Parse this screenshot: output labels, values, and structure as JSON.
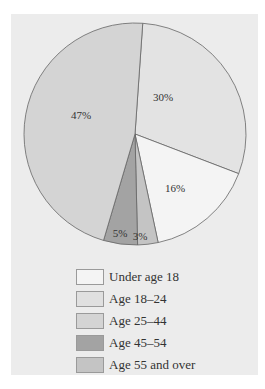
{
  "chart_data": {
    "type": "pie",
    "title": "",
    "slices": [
      {
        "label": "Age 18–24",
        "value": 30,
        "display": "30%",
        "color": "#e3e3e3"
      },
      {
        "label": "Under age 18",
        "value": 16,
        "display": "16%",
        "color": "#f4f4f4"
      },
      {
        "label": "Age 55 and over",
        "value": 3,
        "display": "3%",
        "color": "#c4c4c4"
      },
      {
        "label": "Age 45–54",
        "value": 5,
        "display": "5%",
        "color": "#a3a3a3"
      },
      {
        "label": "Age 25–44",
        "value": 47,
        "display": "47%",
        "color": "#d4d4d4"
      }
    ],
    "start_angle_deg": 4,
    "direction": "clockwise",
    "legend": {
      "position": "bottom",
      "entries": [
        {
          "label": "Under age 18",
          "color": "#f4f4f4"
        },
        {
          "label": "Age 18–24",
          "color": "#e0e0e0"
        },
        {
          "label": "Age 25–44",
          "color": "#d4d4d4"
        },
        {
          "label": "Age 45–54",
          "color": "#a3a3a3"
        },
        {
          "label": "Age 55 and over",
          "color": "#c4c4c4"
        }
      ]
    }
  }
}
